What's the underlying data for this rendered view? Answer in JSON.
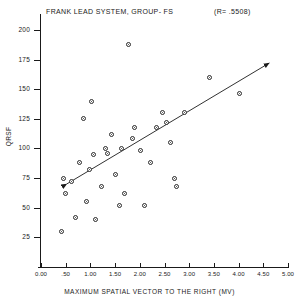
{
  "chart_data": {
    "type": "scatter",
    "title": "FRANK LEAD SYSTEM, GROUP- FS",
    "annotation": "(R=   .5508)",
    "correlation": 0.5508,
    "xlabel": "MAXIMUM SPATIAL VECTOR TO THE RIGHT (MV)",
    "ylabel": "QRSF",
    "xlim": [
      0.0,
      5.0
    ],
    "ylim": [
      0,
      210
    ],
    "grid": false,
    "legend": null,
    "xticks": [
      "0.00",
      ".50",
      "1.00",
      "1.50",
      "2.00",
      "2.50",
      "3.00",
      "3.50",
      "4.00",
      "4.50",
      "5.00"
    ],
    "xtick_values": [
      0.0,
      0.5,
      1.0,
      1.5,
      2.0,
      2.5,
      3.0,
      3.5,
      4.0,
      4.5,
      5.0
    ],
    "yticks": [
      "200",
      "175",
      "150",
      "125",
      "100",
      "75",
      "50",
      "25"
    ],
    "ytick_values": [
      200,
      175,
      150,
      125,
      100,
      75,
      50,
      25
    ],
    "points": [
      {
        "x": 0.42,
        "y": 30
      },
      {
        "x": 0.46,
        "y": 75
      },
      {
        "x": 0.5,
        "y": 62
      },
      {
        "x": 0.62,
        "y": 72
      },
      {
        "x": 0.7,
        "y": 42
      },
      {
        "x": 0.78,
        "y": 88
      },
      {
        "x": 0.86,
        "y": 125
      },
      {
        "x": 0.92,
        "y": 55
      },
      {
        "x": 0.98,
        "y": 82
      },
      {
        "x": 1.02,
        "y": 140
      },
      {
        "x": 1.06,
        "y": 95
      },
      {
        "x": 1.1,
        "y": 40
      },
      {
        "x": 1.22,
        "y": 68
      },
      {
        "x": 1.3,
        "y": 100
      },
      {
        "x": 1.34,
        "y": 96
      },
      {
        "x": 1.42,
        "y": 112
      },
      {
        "x": 1.5,
        "y": 78
      },
      {
        "x": 1.58,
        "y": 52
      },
      {
        "x": 1.62,
        "y": 100
      },
      {
        "x": 1.7,
        "y": 62
      },
      {
        "x": 1.78,
        "y": 188
      },
      {
        "x": 1.86,
        "y": 108
      },
      {
        "x": 1.9,
        "y": 118
      },
      {
        "x": 2.02,
        "y": 98
      },
      {
        "x": 2.1,
        "y": 52
      },
      {
        "x": 2.22,
        "y": 88
      },
      {
        "x": 2.34,
        "y": 118
      },
      {
        "x": 2.46,
        "y": 130
      },
      {
        "x": 2.54,
        "y": 122
      },
      {
        "x": 2.62,
        "y": 105
      },
      {
        "x": 2.7,
        "y": 75
      },
      {
        "x": 2.74,
        "y": 68
      },
      {
        "x": 2.9,
        "y": 130
      },
      {
        "x": 3.42,
        "y": 160
      },
      {
        "x": 4.02,
        "y": 146
      }
    ],
    "regression_line": {
      "x0": 0.52,
      "y0": 70,
      "x1": 4.62,
      "y1": 172,
      "arrow_both_ends": true
    }
  }
}
